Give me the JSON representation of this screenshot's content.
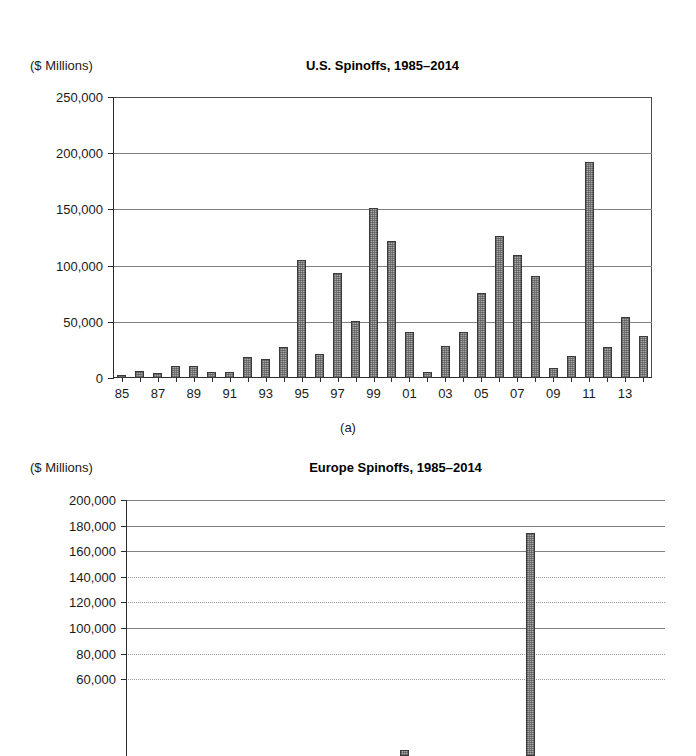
{
  "figure": {
    "panel_a_letter": "(a)"
  },
  "charts": [
    {
      "id": "us-spinoffs",
      "units_label": "($ Millions)",
      "title": "U.S. Spinoffs, 1985–2014",
      "panel_letter": "(a)"
    },
    {
      "id": "europe-spinoffs",
      "units_label": "($ Millions)",
      "title": "Europe Spinoffs, 1985–2014",
      "panel_letter": ""
    }
  ],
  "chart_data": [
    {
      "type": "bar",
      "title": "U.S. Spinoffs, 1985–2014",
      "xlabel": "",
      "ylabel": "($ Millions)",
      "ylim": [
        0,
        250000
      ],
      "ytick_values": [
        0,
        50000,
        100000,
        150000,
        200000,
        250000
      ],
      "ytick_labels": [
        "0",
        "50,000",
        "100,000",
        "150,000",
        "200,000",
        "250,000"
      ],
      "grid": true,
      "legend": "none",
      "categories": [
        "85",
        "86",
        "87",
        "88",
        "89",
        "90",
        "91",
        "92",
        "93",
        "94",
        "95",
        "96",
        "97",
        "98",
        "99",
        "00",
        "01",
        "02",
        "03",
        "04",
        "05",
        "06",
        "07",
        "08",
        "09",
        "10",
        "11",
        "12",
        "13",
        "14"
      ],
      "xtick_labels": [
        "85",
        "",
        "87",
        "",
        "89",
        "",
        "91",
        "",
        "93",
        "",
        "95",
        "",
        "97",
        "",
        "99",
        "",
        "01",
        "",
        "03",
        "",
        "05",
        "",
        "07",
        "",
        "09",
        "",
        "11",
        "",
        "13",
        ""
      ],
      "values": [
        3000,
        6500,
        4500,
        11000,
        10500,
        5500,
        5500,
        18500,
        16500,
        27500,
        105000,
        21500,
        93000,
        50500,
        151000,
        122000,
        41000,
        5500,
        28500,
        41000,
        76000,
        126000,
        109000,
        91000,
        8500,
        20000,
        192000,
        27500,
        54000,
        37000
      ]
    },
    {
      "type": "bar",
      "title": "Europe Spinoffs, 1985–2014",
      "xlabel": "",
      "ylabel": "($ Millions)",
      "ylim": [
        0,
        200000
      ],
      "ytick_values": [
        60000,
        80000,
        100000,
        120000,
        140000,
        160000,
        180000,
        200000
      ],
      "ytick_labels": [
        "60,000",
        "80,000",
        "100,000",
        "120,000",
        "140,000",
        "160,000",
        "180,000",
        "200,000"
      ],
      "grid": true,
      "legend": "none",
      "categories": [
        "85",
        "86",
        "87",
        "88",
        "89",
        "90",
        "91",
        "92",
        "93",
        "94",
        "95",
        "96",
        "97",
        "98",
        "99",
        "00",
        "01",
        "02",
        "03",
        "04",
        "05",
        "06",
        "07",
        "08",
        "09",
        "10",
        "11",
        "12",
        "13",
        "14"
      ],
      "values": [
        0,
        0,
        0,
        0,
        0,
        0,
        0,
        0,
        0,
        0,
        0,
        0,
        0,
        0,
        0,
        5000,
        0,
        0,
        0,
        0,
        0,
        0,
        174000,
        0,
        0,
        0,
        0,
        0,
        0,
        0
      ]
    }
  ]
}
